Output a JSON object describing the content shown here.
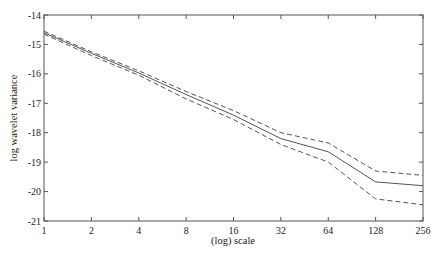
{
  "chart_data": {
    "type": "line",
    "title": "",
    "xlabel": "(log) scale",
    "ylabel": "log wavelet variance",
    "x": [
      1,
      2,
      4,
      8,
      16,
      32,
      64,
      128,
      256
    ],
    "x_tick_labels": [
      "1",
      "2",
      "4",
      "8",
      "16",
      "32",
      "64",
      "128",
      "256"
    ],
    "x_scale": "log2",
    "xlim": [
      1,
      256
    ],
    "y_tick_labels": [
      "-14",
      "-15",
      "-16",
      "-17",
      "-18",
      "-19",
      "-20",
      "-21"
    ],
    "y_ticks": [
      -14,
      -15,
      -16,
      -17,
      -18,
      -19,
      -20,
      -21
    ],
    "ylim": [
      -21,
      -14
    ],
    "grid": false,
    "legend": null,
    "series": [
      {
        "name": "estimate",
        "style": "solid",
        "values": [
          -14.6,
          -15.3,
          -15.97,
          -16.7,
          -17.4,
          -18.2,
          -18.65,
          -19.67,
          -19.8
        ]
      },
      {
        "name": "upper bound",
        "style": "dashed",
        "values": [
          -14.55,
          -15.25,
          -15.9,
          -16.6,
          -17.25,
          -18.0,
          -18.35,
          -19.3,
          -19.45
        ]
      },
      {
        "name": "lower bound",
        "style": "dashed",
        "values": [
          -14.65,
          -15.38,
          -16.05,
          -16.85,
          -17.55,
          -18.4,
          -19.0,
          -20.25,
          -20.45
        ]
      }
    ]
  },
  "colors": {
    "line": "#555555",
    "axis": "#555555",
    "text": "#222222"
  }
}
